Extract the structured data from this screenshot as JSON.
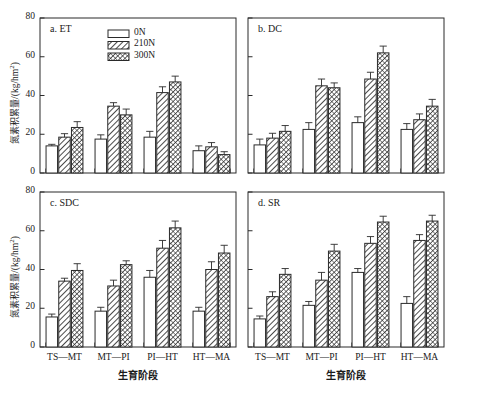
{
  "figure": {
    "ylabel_cn": "氮素积累量",
    "ylabel_unit": "/(kg/hm",
    "ylabel_unit_sup": "2",
    "ylabel_unit_end": ")",
    "xlabel_cn": "生育阶段"
  },
  "legend": {
    "items": [
      {
        "label": "0N",
        "pattern": "solid-white"
      },
      {
        "label": "210N",
        "pattern": "diagonal-hatch"
      },
      {
        "label": "300N",
        "pattern": "dense-cross-hatch"
      }
    ]
  },
  "chart_data": [
    {
      "type": "bar",
      "title": "a. ET",
      "panel": "a",
      "xlabel": "生育阶段",
      "ylabel": "氮素积累量/(kg/hm2)",
      "ylim": [
        0,
        80
      ],
      "yticks": [
        0,
        20,
        40,
        60,
        80
      ],
      "ytick_labels": [
        "0",
        "20",
        "40",
        "60",
        "80"
      ],
      "categories": [
        "TS—MT",
        "MT—PI",
        "PI—HT",
        "HT—MA"
      ],
      "grid": false,
      "legend_position": "top-center",
      "series": [
        {
          "name": "0N",
          "values": [
            14.0,
            17.5,
            18.5,
            11.5
          ],
          "errors": [
            0.8,
            2.2,
            3.0,
            2.5
          ]
        },
        {
          "name": "210N",
          "values": [
            18.5,
            34.5,
            41.5,
            13.5
          ],
          "errors": [
            1.8,
            1.8,
            3.0,
            2.2
          ]
        },
        {
          "name": "300N",
          "values": [
            23.5,
            30.0,
            47.0,
            9.5
          ],
          "errors": [
            3.0,
            3.0,
            3.0,
            1.5
          ]
        }
      ]
    },
    {
      "type": "bar",
      "title": "b. DC",
      "panel": "b",
      "xlabel": "生育阶段",
      "ylabel": "氮素积累量/(kg/hm2)",
      "ylim": [
        0,
        80
      ],
      "yticks": [
        0,
        20,
        40,
        60,
        80
      ],
      "ytick_labels": [
        "",
        "",
        "",
        "",
        ""
      ],
      "categories": [
        "TS—MT",
        "MT—PI",
        "PI—HT",
        "HT—MA"
      ],
      "grid": false,
      "legend_position": "none",
      "series": [
        {
          "name": "0N",
          "values": [
            14.5,
            22.5,
            26.0,
            22.5
          ],
          "errors": [
            3.0,
            3.5,
            3.0,
            3.0
          ]
        },
        {
          "name": "210N",
          "values": [
            18.0,
            45.0,
            48.5,
            27.5
          ],
          "errors": [
            2.5,
            3.5,
            3.5,
            3.0
          ]
        },
        {
          "name": "300N",
          "values": [
            21.5,
            44.0,
            62.0,
            34.5
          ],
          "errors": [
            3.0,
            2.5,
            3.5,
            3.5
          ]
        }
      ]
    },
    {
      "type": "bar",
      "title": "c. SDC",
      "panel": "c",
      "xlabel": "生育阶段",
      "ylabel": "氮素积累量/(kg/hm2)",
      "ylim": [
        0,
        80
      ],
      "yticks": [
        0,
        20,
        40,
        60,
        80
      ],
      "ytick_labels": [
        "0",
        "20",
        "40",
        "60",
        "80"
      ],
      "categories": [
        "TS—MT",
        "MT—PI",
        "PI—HT",
        "HT—MA"
      ],
      "grid": false,
      "legend_position": "none",
      "series": [
        {
          "name": "0N",
          "values": [
            15.5,
            18.5,
            36.0,
            18.5
          ],
          "errors": [
            1.5,
            2.0,
            3.5,
            2.0
          ]
        },
        {
          "name": "210N",
          "values": [
            34.0,
            31.5,
            51.0,
            40.0
          ],
          "errors": [
            1.5,
            3.0,
            4.0,
            4.0
          ]
        },
        {
          "name": "300N",
          "values": [
            39.5,
            42.5,
            61.5,
            48.5
          ],
          "errors": [
            3.5,
            2.0,
            3.5,
            4.0
          ]
        }
      ]
    },
    {
      "type": "bar",
      "title": "d. SR",
      "panel": "d",
      "xlabel": "生育阶段",
      "ylabel": "氮素积累量/(kg/hm2)",
      "ylim": [
        0,
        80
      ],
      "yticks": [
        0,
        20,
        40,
        60,
        80
      ],
      "ytick_labels": [
        "",
        "",
        "",
        "",
        ""
      ],
      "categories": [
        "TS—MT",
        "MT—PI",
        "PI—HT",
        "HT—MA"
      ],
      "grid": false,
      "legend_position": "none",
      "series": [
        {
          "name": "0N",
          "values": [
            14.5,
            21.5,
            38.5,
            22.5
          ],
          "errors": [
            1.5,
            2.0,
            2.0,
            3.5
          ]
        },
        {
          "name": "210N",
          "values": [
            26.0,
            34.5,
            53.5,
            55.0
          ],
          "errors": [
            2.5,
            4.0,
            3.5,
            3.0
          ]
        },
        {
          "name": "300N",
          "values": [
            37.5,
            49.5,
            64.5,
            65.0
          ],
          "errors": [
            3.0,
            3.5,
            3.0,
            3.0
          ]
        }
      ]
    }
  ]
}
